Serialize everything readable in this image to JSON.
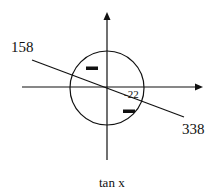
{
  "diagram": {
    "type": "unit-circle-sign-diagram",
    "function_label": "tan x",
    "angle_labels": {
      "upper_left": "158",
      "lower_right": "338",
      "reference": "-22"
    },
    "quadrant_signs": {
      "second_quadrant": "−",
      "fourth_quadrant": "−"
    },
    "colors": {
      "stroke": "#111111",
      "background": "#ffffff"
    }
  }
}
